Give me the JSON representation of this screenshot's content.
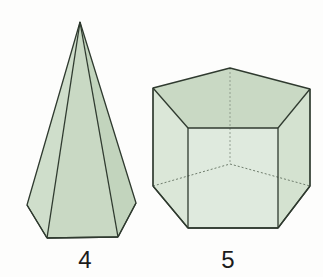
{
  "page": {
    "background_color": "#fdfdfc"
  },
  "figures": [
    {
      "id": "pentagonal-pyramid",
      "label": "4",
      "shape_name": "pentagonal pyramid",
      "label_x": 65,
      "label_y": 246
    },
    {
      "id": "pentagonal-prism",
      "label": "5",
      "shape_name": "pentagonal prism",
      "label_x": 208,
      "label_y": 246
    }
  ],
  "style": {
    "fill_light": "#dbe7d8",
    "fill_mid": "#c9d9c4",
    "fill_dark": "#bed0b8",
    "fill_base": "#c2d4bd",
    "edge_color": "#2f3a2f",
    "hidden_edge_color": "#6f7d6d",
    "edge_width": 1.3,
    "hidden_edge_width": 0.9,
    "hidden_edge_dash": "2,2"
  },
  "geometry": {
    "pyramid": {
      "apex": [
        80,
        22
      ],
      "base_front_left": [
        47,
        238
      ],
      "base_front_right": [
        118,
        237
      ],
      "base_left": [
        27,
        205
      ],
      "base_right": [
        136,
        203
      ],
      "base_back": [
        82,
        182
      ]
    },
    "prism": {
      "top_back": [
        230,
        68
      ],
      "top_left": [
        153,
        88
      ],
      "top_right": [
        310,
        89
      ],
      "top_front_left": [
        188,
        128
      ],
      "top_front_right": [
        278,
        128
      ],
      "bottom_left": [
        153,
        186
      ],
      "bottom_right": [
        310,
        186
      ],
      "bottom_front_left": [
        188,
        228
      ],
      "bottom_front_right": [
        278,
        228
      ],
      "bottom_back": [
        230,
        164
      ]
    }
  }
}
